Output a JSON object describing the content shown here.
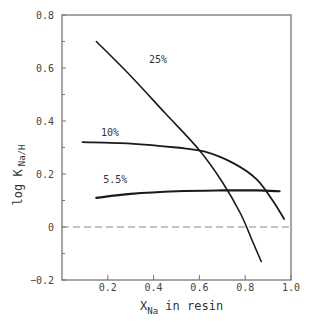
{
  "chart_data": {
    "type": "line",
    "title": "",
    "xlabel": "X_Na in resin",
    "xlabel_main": "X",
    "xlabel_sub": "Na",
    "xlabel_rest": " in resin",
    "ylabel": "log K Na/H",
    "ylabel_main": "log K",
    "ylabel_sub": "Na/H",
    "xlim": [
      0,
      1.0
    ],
    "ylim": [
      -0.2,
      0.8
    ],
    "x_ticks": [
      "0.2",
      "0.4",
      "0.6",
      "0.8",
      "1.0"
    ],
    "y_ticks": [
      "-0.2",
      "0",
      "0.2",
      "0.4",
      "0.6",
      "0.8"
    ],
    "grid": false,
    "legend": "inline labels on curves",
    "reference_line": {
      "y": 0,
      "style": "dashed"
    },
    "series": [
      {
        "name": "25%",
        "x": [
          0.15,
          0.3,
          0.45,
          0.6,
          0.7,
          0.78,
          0.83,
          0.87
        ],
        "y": [
          0.7,
          0.57,
          0.43,
          0.29,
          0.17,
          0.05,
          -0.05,
          -0.13
        ]
      },
      {
        "name": "10%",
        "x": [
          0.09,
          0.3,
          0.5,
          0.62,
          0.75,
          0.85,
          0.92,
          0.97
        ],
        "y": [
          0.32,
          0.315,
          0.3,
          0.285,
          0.24,
          0.18,
          0.1,
          0.03
        ]
      },
      {
        "name": "5.5%",
        "x": [
          0.15,
          0.3,
          0.5,
          0.7,
          0.85,
          0.95
        ],
        "y": [
          0.11,
          0.125,
          0.135,
          0.138,
          0.138,
          0.135
        ]
      }
    ]
  }
}
